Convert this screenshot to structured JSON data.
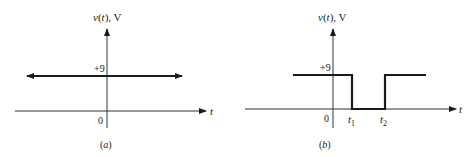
{
  "panels": [
    {
      "id": "a",
      "caption": "(a)",
      "y_axis_label": "v(t), V",
      "x_axis_label": "t",
      "origin_label": "0",
      "level_label": "+9",
      "description": "Constant DC voltage of +9 V for all time (line with arrows at both ends)"
    },
    {
      "id": "b",
      "caption": "(b)",
      "y_axis_label": "v(t), V",
      "x_axis_label": "t",
      "origin_label": "0",
      "level_label": "+9",
      "t1_label": "t",
      "t1_sub": "1",
      "t2_label": "t",
      "t2_sub": "2",
      "description": "Voltage of +9 V except between t1 and t2 where it drops to 0"
    }
  ],
  "colors": {
    "line": "#1a1a1a",
    "axis": "#333333",
    "background": "#ffffff"
  }
}
